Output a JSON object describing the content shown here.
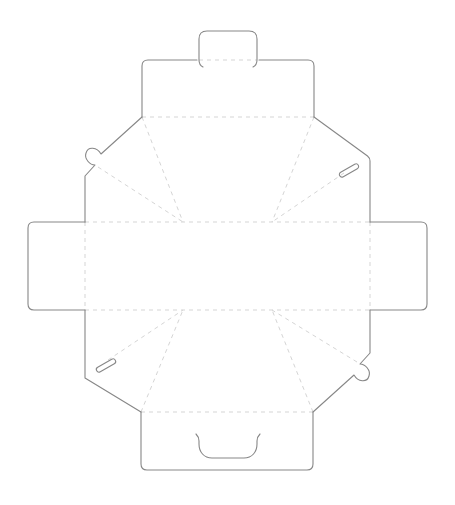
{
  "canvas": {
    "width": 455,
    "height": 505,
    "background": "#ffffff"
  },
  "style": {
    "cut_color": "#878787",
    "cut_width": 1.1,
    "fold_color": "#d5d5d5",
    "fold_width": 1,
    "fold_dash": "4 4"
  },
  "dieline": {
    "cut_lines": [
      {
        "name": "tuck-tab-outline",
        "d": "M203,67 C199,65 199,62 199,60 L199,39 Q199,31 207,31 L249,31 Q257,31 257,39 L257,60 C257,62 257,65 253,67"
      },
      {
        "name": "top-flap-left-edge",
        "d": "M197,60 L148,60 Q142,60 142,66 L142,117"
      },
      {
        "name": "top-flap-right-edge",
        "d": "M259,60 L308,60 Q314,60 314,66 L314,117"
      },
      {
        "name": "top-left-corner-edge-with-ear-hook",
        "d": "M142,117 L101,154 C97,147 88,146 86,153 C84,159 90,165 95,165 L85,176 L85,222"
      },
      {
        "name": "left-flap-outline",
        "d": "M85,222 L34,222 Q28,222 28,228 L28,304 Q28,310 34,310 L85,310"
      },
      {
        "name": "bottom-left-corner-edge",
        "d": "M85,310 L85,378 L141,412"
      },
      {
        "name": "bottom-flap-outline",
        "d": "M141,412 L141,464 Q141,470 147,470 L307,470 Q313,470 313,464 L313,412"
      },
      {
        "name": "bottom-right-corner-edge-with-ear-hook",
        "d": "M313,412 L354,375 C358,382 367,383 369,376 C371,370 365,364 360,364 L370,353 L370,310"
      },
      {
        "name": "right-flap-outline",
        "d": "M370,310 L421,310 Q427,310 427,304 L427,228 Q427,222 421,222 L370,222"
      },
      {
        "name": "top-right-corner-edge",
        "d": "M370,222 L370,161 Q370,158 367.5,156 L314,117"
      },
      {
        "name": "top-right-lock-slot",
        "d": "M343.3,176.8 L357.3,168.8 A2.6,2.6 0 0 0 354.7,164.2 L340.7,172.2 A2.6,2.6 0 0 0 343.3,176.8 Z"
      },
      {
        "name": "bottom-left-lock-slot",
        "d": "M100.3,371.8 L114.3,363.8 A2.6,2.6 0 0 0 111.7,359.2 L97.7,367.2 A2.6,2.6 0 0 0 100.3,371.8 Z"
      },
      {
        "name": "thumb-notch-cut",
        "d": "M196,434 C198,436 199,438 199,441 L199,444 C199,452 204,458 212,458 L244,458 C252,458 257,452 257,444 L257,441 C257,438 258,436 260,434"
      }
    ],
    "fold_lines": [
      {
        "name": "tuck-tab-fold",
        "d": "M199,60 L257,60"
      },
      {
        "name": "top-flap-fold",
        "d": "M142,117 L314,117"
      },
      {
        "name": "upper-horizontal-fold",
        "d": "M85,222 L370,222"
      },
      {
        "name": "lower-horizontal-fold",
        "d": "M85,310 L370,310"
      },
      {
        "name": "left-flap-fold",
        "d": "M85,222 L85,310"
      },
      {
        "name": "right-flap-fold",
        "d": "M370,222 L370,310"
      },
      {
        "name": "bottom-flap-fold",
        "d": "M141,412 L313,412"
      },
      {
        "name": "top-left-steep-diagonal-fold",
        "d": "M142,117 L183,222"
      },
      {
        "name": "top-left-shallow-diagonal-fold",
        "d": "M98,167 L183,222"
      },
      {
        "name": "top-right-steep-diagonal-fold",
        "d": "M314,117 L272,222"
      },
      {
        "name": "top-right-shallow-diagonal-fold",
        "d": "M344,173 L272,222"
      },
      {
        "name": "bottom-left-steep-diagonal-fold",
        "d": "M141,412 L183,310"
      },
      {
        "name": "bottom-left-shallow-diagonal-fold",
        "d": "M108,360 L183,310"
      },
      {
        "name": "bottom-right-steep-diagonal-fold",
        "d": "M313,412 L272,310"
      },
      {
        "name": "bottom-right-shallow-diagonal-fold",
        "d": "M357,362 L272,310"
      }
    ]
  }
}
